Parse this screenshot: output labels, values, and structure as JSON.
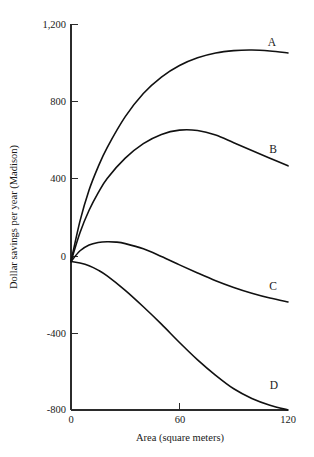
{
  "chart_data": {
    "type": "line",
    "title": "",
    "xlabel": "Area (square meters)",
    "ylabel": "Dollar savings per year (Madison)",
    "xlim": [
      0,
      120
    ],
    "ylim": [
      -800,
      1200
    ],
    "xticks": [
      0,
      60,
      120
    ],
    "xticklabels": [
      "0",
      "60",
      "120"
    ],
    "yticks": [
      -800,
      -400,
      0,
      400,
      800,
      1200
    ],
    "yticklabels": [
      "-800",
      "-400",
      "0",
      "400",
      "800",
      "1,200"
    ],
    "grid": false,
    "legend": "inline-end-labels",
    "series": [
      {
        "name": "A",
        "label": "A",
        "x": [
          0,
          5,
          10,
          15,
          20,
          30,
          40,
          50,
          60,
          70,
          80,
          90,
          100,
          110,
          120
        ],
        "y": [
          -30,
          180,
          340,
          460,
          560,
          720,
          840,
          925,
          985,
          1025,
          1050,
          1062,
          1065,
          1060,
          1050
        ]
      },
      {
        "name": "B",
        "label": "B",
        "x": [
          0,
          5,
          10,
          15,
          20,
          30,
          40,
          50,
          60,
          70,
          80,
          90,
          100,
          110,
          120
        ],
        "y": [
          -30,
          120,
          235,
          325,
          400,
          505,
          580,
          628,
          650,
          648,
          625,
          585,
          545,
          505,
          465
        ]
      },
      {
        "name": "C",
        "label": "C",
        "x": [
          0,
          5,
          10,
          15,
          20,
          25,
          30,
          40,
          50,
          60,
          70,
          80,
          90,
          100,
          110,
          120
        ],
        "y": [
          -30,
          25,
          55,
          68,
          72,
          70,
          62,
          35,
          -5,
          -48,
          -90,
          -130,
          -165,
          -195,
          -220,
          -240
        ]
      },
      {
        "name": "D",
        "label": "D",
        "x": [
          0,
          5,
          10,
          15,
          20,
          30,
          40,
          50,
          60,
          70,
          80,
          90,
          100,
          110,
          120
        ],
        "y": [
          -30,
          -38,
          -52,
          -75,
          -105,
          -180,
          -265,
          -355,
          -450,
          -540,
          -620,
          -690,
          -740,
          -775,
          -800
        ]
      }
    ]
  },
  "axes": {
    "x_title": "Area (square meters)",
    "y_title": "Dollar savings per year (Madison)",
    "x_tick_labels": [
      "0",
      "60",
      "120"
    ],
    "y_tick_labels": [
      "1,200",
      "800",
      "400",
      "0",
      "-400",
      "-800"
    ]
  },
  "curve_labels": {
    "a": "A",
    "b": "B",
    "c": "C",
    "d": "D"
  },
  "colors": {
    "curve": "#111111",
    "axis": "#2b2b2b",
    "text": "#1a1a1a",
    "background": "#ffffff"
  }
}
